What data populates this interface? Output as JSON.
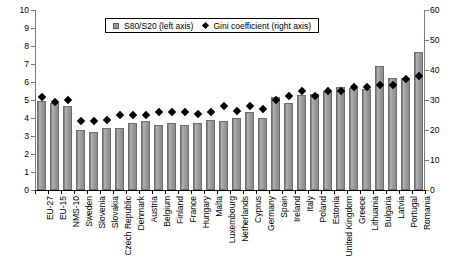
{
  "chart_data": {
    "type": "bar",
    "title": "",
    "xlabel": "",
    "ylabel": "",
    "grid": false,
    "legend_position": "top-center",
    "ylim": [
      0,
      10
    ],
    "y2lim": [
      0,
      60
    ],
    "y_ticks": [
      0,
      1,
      2,
      3,
      4,
      5,
      6,
      7,
      8,
      9,
      10
    ],
    "y2_ticks": [
      0,
      10,
      20,
      30,
      40,
      50,
      60
    ],
    "categories": [
      "EU-27",
      "EU-15",
      "NMS-10",
      "Sweden",
      "Slovenia",
      "Slovakia",
      "Czech Republic",
      "Denmark",
      "Austria",
      "Belgium",
      "Finland",
      "France",
      "Hungary",
      "Malta",
      "Luxembourg",
      "Netherlands",
      "Cyprus",
      "Germany",
      "Spain",
      "Ireland",
      "Italy",
      "Poland",
      "Estonia",
      "United Kingdom",
      "Greece",
      "Lithuania",
      "Bulgaria",
      "Latvia",
      "Portugal",
      "Romania"
    ],
    "series": [
      {
        "name": "S80/S20 (left axis)",
        "axis": "left",
        "marker": "bar",
        "values": [
          4.95,
          4.85,
          4.65,
          3.35,
          3.2,
          3.45,
          3.45,
          3.75,
          3.85,
          3.6,
          3.7,
          3.6,
          3.75,
          3.9,
          3.85,
          4.0,
          4.35,
          4.0,
          5.15,
          4.85,
          5.3,
          5.35,
          5.5,
          5.75,
          5.65,
          5.6,
          6.9,
          6.25,
          6.25,
          7.65
        ]
      },
      {
        "name": "Gini coefficient (right axis)",
        "axis": "right",
        "marker": "diamond",
        "values": [
          31.0,
          29.5,
          30.0,
          23.0,
          23.0,
          23.5,
          25.0,
          25.0,
          25.0,
          26.0,
          26.0,
          26.0,
          25.5,
          26.0,
          28.0,
          26.5,
          28.0,
          27.0,
          30.0,
          31.5,
          33.0,
          31.5,
          33.0,
          33.0,
          34.5,
          34.5,
          35.0,
          35.0,
          37.0,
          38.0
        ]
      }
    ],
    "legend": [
      {
        "label": "S80/S20 (left axis)",
        "marker": "square",
        "color": "#9a9a9a"
      },
      {
        "label": "Gini coefficient (right axis)",
        "marker": "diamond",
        "color": "#000000"
      }
    ]
  }
}
